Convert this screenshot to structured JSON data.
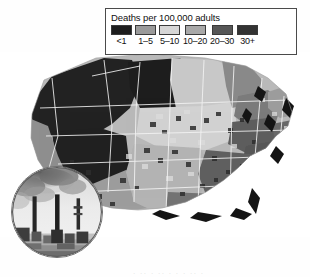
{
  "figure": {
    "type": "choropleth-map",
    "bottom_cutoff_text": "· ·· · ·· · · · ·· ·"
  },
  "legend": {
    "title": "Deaths per 100,000 adults",
    "items": [
      {
        "label": "<1",
        "color": "#1d1d1d"
      },
      {
        "label": "1–5",
        "color": "#9a9a9a"
      },
      {
        "label": "5–10",
        "color": "#d6d6d6"
      },
      {
        "label": "10–20",
        "color": "#a8a8a8"
      },
      {
        "label": "20–30",
        "color": "#565656"
      },
      {
        "label": "30+",
        "color": "#333333"
      }
    ]
  },
  "map": {
    "name": "united-states-county-choropleth",
    "ocean_color": "#ffffff",
    "border_color": "#f2f2f2",
    "coast_shadow_color": "#111111",
    "regions": [
      {
        "name": "pacific-northwest",
        "color": "#232323"
      },
      {
        "name": "northern-rockies",
        "color": "#1e1e1e"
      },
      {
        "name": "great-basin",
        "color": "#222222"
      },
      {
        "name": "california",
        "color": "#8f8f8f"
      },
      {
        "name": "southwest",
        "color": "#9d9d9d"
      },
      {
        "name": "northern-plains",
        "color": "#c9c9c9"
      },
      {
        "name": "central-plains",
        "color": "#d2d2d2"
      },
      {
        "name": "southern-plains",
        "color": "#b5b5b5"
      },
      {
        "name": "upper-midwest",
        "color": "#8a8a8a"
      },
      {
        "name": "great-lakes",
        "color": "#7c7c7c"
      },
      {
        "name": "ohio-valley",
        "color": "#5e5e5e"
      },
      {
        "name": "appalachia",
        "color": "#585858"
      },
      {
        "name": "southeast",
        "color": "#606060"
      },
      {
        "name": "gulf-coast",
        "color": "#747474"
      },
      {
        "name": "mid-atlantic",
        "color": "#6a6a6a"
      },
      {
        "name": "northeast",
        "color": "#9c9c9c"
      },
      {
        "name": "new-england",
        "color": "#b0b0b0"
      }
    ]
  },
  "inset": {
    "name": "smokestack-photo",
    "caption": "",
    "description": "industrial smokestacks emitting smoke plumes",
    "sky_color": "#e9e9e9",
    "smoke_color": "#7a7a7a",
    "stack_color": "#2a2a2a",
    "ground_color": "#c4c4c4"
  }
}
